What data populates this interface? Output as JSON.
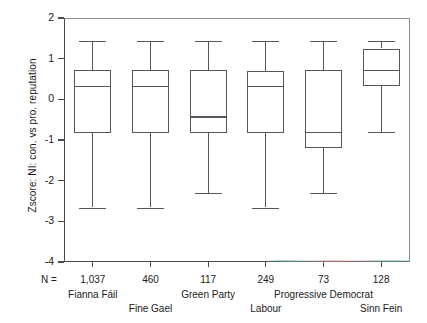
{
  "chart_data": {
    "type": "box",
    "title": "",
    "xlabel": "",
    "ylabel": "Zscore: NI: con. vs pro. reputation",
    "ylim": [
      -4,
      2
    ],
    "yticks": [
      2,
      1,
      0,
      -1,
      -2,
      -3,
      -4
    ],
    "ytick_labels": [
      "2",
      "1",
      "0",
      "-1",
      "-2",
      "-3",
      "-4"
    ],
    "grid": false,
    "legend": "none",
    "n_label": "N =",
    "categories": [
      "Fianna Fáil",
      "Fine Gael",
      "Green Party",
      "Labour",
      "Progressive Democrat",
      "Sinn Fein"
    ],
    "n_values": [
      "1,037",
      "460",
      "117",
      "249",
      "73",
      "128"
    ],
    "boxes": [
      {
        "category": "Fianna Fáil",
        "whisker_low": -2.66,
        "q1": -0.82,
        "median": 0.34,
        "q3": 0.72,
        "whisker_high": 1.43
      },
      {
        "category": "Fine Gael",
        "whisker_low": -2.66,
        "q1": -0.84,
        "median": 0.34,
        "q3": 0.72,
        "whisker_high": 1.43
      },
      {
        "category": "Green Party",
        "whisker_low": -2.31,
        "q1": -0.82,
        "median": -0.42,
        "q3": 0.72,
        "whisker_high": 1.43
      },
      {
        "category": "Labour",
        "whisker_low": -2.66,
        "q1": -0.83,
        "median": 0.33,
        "q3": 0.7,
        "whisker_high": 1.43
      },
      {
        "category": "Progressive Democrat",
        "whisker_low": -2.31,
        "q1": -1.2,
        "median": -0.8,
        "q3": 0.72,
        "whisker_high": 1.43
      },
      {
        "category": "Sinn Fein",
        "whisker_low": -0.8,
        "q1": 0.33,
        "median": 0.72,
        "q3": 1.25,
        "whisker_high": 1.43
      }
    ]
  },
  "colors": {
    "line": "#55555f",
    "axis": "#4a4a55",
    "text": "#1a1a1a",
    "background": "#ffffff"
  }
}
